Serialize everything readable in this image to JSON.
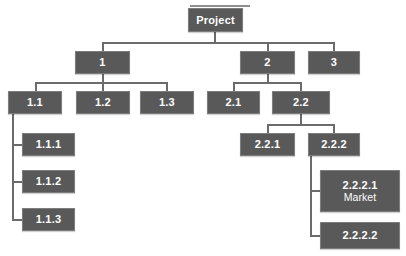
{
  "diagram": {
    "type": "work-breakdown-structure",
    "title": "",
    "node_fill_color": "#595959",
    "node_border_color": "#7d7d7d",
    "node_text_color": "#ffffff",
    "connector_color": "#6b6b6b",
    "background_color": "#ffffff",
    "nodes": [
      {
        "id": "project",
        "label": "Project",
        "label2": "",
        "level": 0,
        "x": 188,
        "y": 8,
        "w": 55,
        "h": 24
      },
      {
        "id": "n1",
        "label": "1",
        "label2": "",
        "level": 1,
        "x": 75,
        "y": 51,
        "w": 55,
        "h": 23
      },
      {
        "id": "n2",
        "label": "2",
        "label2": "",
        "level": 1,
        "x": 240,
        "y": 51,
        "w": 55,
        "h": 23
      },
      {
        "id": "n3",
        "label": "3",
        "label2": "",
        "level": 1,
        "x": 308,
        "y": 51,
        "w": 52,
        "h": 23
      },
      {
        "id": "n11",
        "label": "1.1",
        "label2": "",
        "level": 2,
        "x": 8,
        "y": 91,
        "w": 54,
        "h": 23
      },
      {
        "id": "n12",
        "label": "1.2",
        "label2": "",
        "level": 2,
        "x": 76,
        "y": 91,
        "w": 54,
        "h": 23
      },
      {
        "id": "n13",
        "label": "1.3",
        "label2": "",
        "level": 2,
        "x": 140,
        "y": 91,
        "w": 54,
        "h": 23
      },
      {
        "id": "n21",
        "label": "2.1",
        "label2": "",
        "level": 2,
        "x": 207,
        "y": 91,
        "w": 53,
        "h": 23
      },
      {
        "id": "n22",
        "label": "2.2",
        "label2": "",
        "level": 2,
        "x": 272,
        "y": 91,
        "w": 58,
        "h": 23
      },
      {
        "id": "n111",
        "label": "1.1.1",
        "label2": "",
        "level": 3,
        "x": 22,
        "y": 133,
        "w": 53,
        "h": 23
      },
      {
        "id": "n112",
        "label": "1.1.2",
        "label2": "",
        "level": 3,
        "x": 22,
        "y": 170,
        "w": 53,
        "h": 23
      },
      {
        "id": "n113",
        "label": "1.1.3",
        "label2": "",
        "level": 3,
        "x": 22,
        "y": 208,
        "w": 53,
        "h": 23
      },
      {
        "id": "n221",
        "label": "2.2.1",
        "label2": "",
        "level": 3,
        "x": 240,
        "y": 133,
        "w": 55,
        "h": 23
      },
      {
        "id": "n222",
        "label": "2.2.2",
        "label2": "",
        "level": 3,
        "x": 308,
        "y": 133,
        "w": 52,
        "h": 23
      },
      {
        "id": "n2221",
        "label": "2.2.2.1",
        "label2": "Market",
        "level": 4,
        "x": 320,
        "y": 170,
        "w": 80,
        "h": 42
      },
      {
        "id": "n2222",
        "label": "2.2.2.2",
        "label2": "",
        "level": 4,
        "x": 320,
        "y": 222,
        "w": 80,
        "h": 27
      }
    ],
    "connectors": [
      {
        "name": "project-stem-down",
        "orient": "v",
        "x": 214,
        "y": 32,
        "len": 11
      },
      {
        "name": "level1-bus",
        "orient": "h",
        "x": 102,
        "y": 42,
        "len": 233
      },
      {
        "name": "drop-to-1",
        "orient": "v",
        "x": 102,
        "y": 42,
        "len": 10
      },
      {
        "name": "drop-to-2",
        "orient": "v",
        "x": 267,
        "y": 42,
        "len": 10
      },
      {
        "name": "drop-to-3",
        "orient": "v",
        "x": 333,
        "y": 42,
        "len": 10
      },
      {
        "name": "node1-stem-down",
        "orient": "v",
        "x": 102,
        "y": 74,
        "len": 9
      },
      {
        "name": "level2a-bus",
        "orient": "h",
        "x": 35,
        "y": 82,
        "len": 132
      },
      {
        "name": "drop-to-1-1",
        "orient": "v",
        "x": 35,
        "y": 82,
        "len": 10
      },
      {
        "name": "drop-to-1-2",
        "orient": "v",
        "x": 102,
        "y": 82,
        "len": 10
      },
      {
        "name": "drop-to-1-3",
        "orient": "v",
        "x": 166,
        "y": 82,
        "len": 10
      },
      {
        "name": "node2-stem-down",
        "orient": "v",
        "x": 267,
        "y": 74,
        "len": 9
      },
      {
        "name": "level2b-bus",
        "orient": "h",
        "x": 233,
        "y": 82,
        "len": 68
      },
      {
        "name": "drop-to-2-1",
        "orient": "v",
        "x": 233,
        "y": 82,
        "len": 10
      },
      {
        "name": "drop-to-2-2",
        "orient": "v",
        "x": 300,
        "y": 82,
        "len": 10
      },
      {
        "name": "node22-stem-down",
        "orient": "v",
        "x": 300,
        "y": 114,
        "len": 10
      },
      {
        "name": "level3b-bus",
        "orient": "h",
        "x": 267,
        "y": 124,
        "len": 67
      },
      {
        "name": "drop-to-2-2-1",
        "orient": "v",
        "x": 267,
        "y": 124,
        "len": 10
      },
      {
        "name": "drop-to-2-2-2",
        "orient": "v",
        "x": 333,
        "y": 124,
        "len": 10
      },
      {
        "name": "node11-trunk",
        "orient": "v",
        "x": 12,
        "y": 114,
        "len": 106
      },
      {
        "name": "stub-to-1-1-1",
        "orient": "h",
        "x": 12,
        "y": 144,
        "len": 11
      },
      {
        "name": "stub-to-1-1-2",
        "orient": "h",
        "x": 12,
        "y": 181,
        "len": 11
      },
      {
        "name": "stub-to-1-1-3",
        "orient": "h",
        "x": 12,
        "y": 219,
        "len": 11
      },
      {
        "name": "node222-trunk",
        "orient": "v",
        "x": 310,
        "y": 156,
        "len": 80
      },
      {
        "name": "stub-to-2-2-2-1",
        "orient": "h",
        "x": 310,
        "y": 190,
        "len": 11
      },
      {
        "name": "stub-to-2-2-2-2",
        "orient": "h",
        "x": 310,
        "y": 235,
        "len": 11
      }
    ],
    "cropped_top_rule": {
      "name": "cropped-rule-above-project",
      "x": 190,
      "y": 5,
      "w": 60
    }
  }
}
